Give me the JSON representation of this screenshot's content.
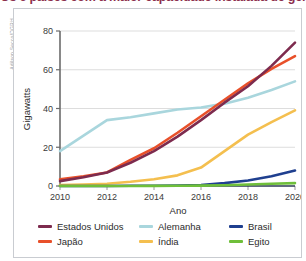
{
  "figure": {
    "title": "Os 6 países com a maior capacidade instalada de geração de energia solar (2010-2020)",
    "title_color": "#8c2f4d",
    "credit": "Adilson Secco/DGRH"
  },
  "chart_data": {
    "type": "line",
    "title": "Os 6 países com a maior capacidade instalada de geração de energia solar (2010-2020)",
    "xlabel": "Ano",
    "ylabel": "Gigawatts",
    "x": [
      2010,
      2011,
      2012,
      2013,
      2014,
      2015,
      2016,
      2017,
      2018,
      2019,
      2020
    ],
    "xlim": [
      2010,
      2020
    ],
    "ylim": [
      0,
      80
    ],
    "xticks": [
      "2010",
      "2012",
      "2014",
      "2016",
      "2018",
      "2020"
    ],
    "yticks": [
      "0",
      "20",
      "40",
      "60",
      "80"
    ],
    "grid": true,
    "legend_position": "bottom",
    "series": [
      {
        "name": "Estados Unidos",
        "color": "#7d2b4e",
        "values": [
          2.5,
          4.5,
          7.0,
          12.0,
          18.0,
          25.5,
          34.0,
          43.0,
          51.5,
          62.0,
          74.0
        ]
      },
      {
        "name": "Japão",
        "color": "#e8502a",
        "values": [
          3.5,
          5.0,
          7.0,
          13.5,
          19.5,
          27.5,
          36.0,
          44.5,
          53.0,
          60.5,
          67.0
        ]
      },
      {
        "name": "Alemanha",
        "color": "#a9d6dd",
        "values": [
          18.0,
          26.0,
          34.0,
          35.5,
          37.5,
          39.5,
          40.5,
          42.5,
          45.5,
          49.5,
          54.0
        ]
      },
      {
        "name": "Índia",
        "color": "#f4bf4f",
        "values": [
          0.5,
          0.8,
          1.2,
          2.2,
          3.5,
          5.5,
          9.5,
          18.0,
          26.5,
          33.0,
          39.0
        ]
      },
      {
        "name": "Brasil",
        "color": "#1f3f8f",
        "values": [
          0.0,
          0.0,
          0.0,
          0.1,
          0.1,
          0.2,
          0.5,
          1.5,
          2.8,
          5.0,
          8.0
        ]
      },
      {
        "name": "Egito",
        "color": "#6fbf3a",
        "values": [
          0.0,
          0.0,
          0.0,
          0.0,
          0.05,
          0.1,
          0.2,
          0.4,
          0.8,
          1.2,
          1.5
        ]
      }
    ]
  },
  "legend": {
    "columns": [
      [
        {
          "label": "Estados Unidos",
          "color": "#7d2b4e"
        },
        {
          "label": "Japão",
          "color": "#e8502a"
        }
      ],
      [
        {
          "label": "Alemanha",
          "color": "#a9d6dd"
        },
        {
          "label": "Índia",
          "color": "#f4bf4f"
        }
      ],
      [
        {
          "label": "Brasil",
          "color": "#1f3f8f"
        },
        {
          "label": "Egito",
          "color": "#6fbf3a"
        }
      ]
    ]
  }
}
